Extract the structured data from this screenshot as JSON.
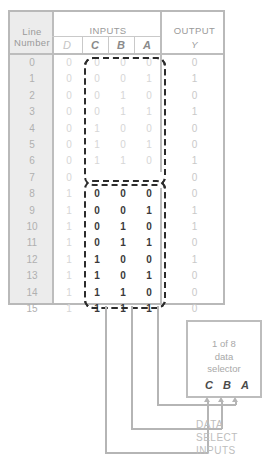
{
  "table": {
    "headers": {
      "line_number": "Line\nNumber",
      "line_number_l1": "Line",
      "line_number_l2": "Number",
      "inputs": "INPUTS",
      "output": "OUTPUT",
      "output_var": "Y",
      "vars": [
        "D",
        "C",
        "B",
        "A"
      ]
    },
    "rows": [
      {
        "line": "0",
        "D": "0",
        "C": "0",
        "B": "0",
        "A": "0",
        "Y": "0",
        "emphasis": "dim"
      },
      {
        "line": "1",
        "D": "0",
        "C": "0",
        "B": "0",
        "A": "1",
        "Y": "1",
        "emphasis": "dim"
      },
      {
        "line": "2",
        "D": "0",
        "C": "0",
        "B": "1",
        "A": "0",
        "Y": "0",
        "emphasis": "dim"
      },
      {
        "line": "3",
        "D": "0",
        "C": "0",
        "B": "1",
        "A": "1",
        "Y": "1",
        "emphasis": "dim"
      },
      {
        "line": "4",
        "D": "0",
        "C": "1",
        "B": "0",
        "A": "0",
        "Y": "0",
        "emphasis": "dim"
      },
      {
        "line": "5",
        "D": "0",
        "C": "1",
        "B": "0",
        "A": "1",
        "Y": "0",
        "emphasis": "dim"
      },
      {
        "line": "6",
        "D": "0",
        "C": "1",
        "B": "1",
        "A": "0",
        "Y": "1",
        "emphasis": "dim"
      },
      {
        "line": "7",
        "D": "0",
        "C": "1",
        "B": "1",
        "A": "1",
        "Y": "0",
        "emphasis": "dim"
      },
      {
        "line": "8",
        "D": "1",
        "C": "0",
        "B": "0",
        "A": "0",
        "Y": "0",
        "emphasis": "bold"
      },
      {
        "line": "9",
        "D": "1",
        "C": "0",
        "B": "0",
        "A": "1",
        "Y": "1",
        "emphasis": "bold"
      },
      {
        "line": "10",
        "D": "1",
        "C": "0",
        "B": "1",
        "A": "0",
        "Y": "1",
        "emphasis": "bold"
      },
      {
        "line": "11",
        "D": "1",
        "C": "0",
        "B": "1",
        "A": "1",
        "Y": "0",
        "emphasis": "bold"
      },
      {
        "line": "12",
        "D": "1",
        "C": "1",
        "B": "0",
        "A": "0",
        "Y": "1",
        "emphasis": "bold"
      },
      {
        "line": "13",
        "D": "1",
        "C": "1",
        "B": "0",
        "A": "1",
        "Y": "0",
        "emphasis": "bold"
      },
      {
        "line": "14",
        "D": "1",
        "C": "1",
        "B": "1",
        "A": "0",
        "Y": "0",
        "emphasis": "bold"
      },
      {
        "line": "15",
        "D": "1",
        "C": "1",
        "B": "1",
        "A": "1",
        "Y": "0",
        "emphasis": "bold"
      }
    ]
  },
  "selector": {
    "label_line1": "1 of 8",
    "label_line2": "data",
    "label_line3": "selector",
    "pins": [
      "C",
      "B",
      "A"
    ]
  },
  "annotations": {
    "data_select_l1": "DATA",
    "data_select_l2": "SELECT",
    "data_select_l3": "INPUTS"
  },
  "colors": {
    "border": "#bdbdbd",
    "grid": "#c9c9c9",
    "dim_text": "#d6d6d6",
    "bold_text": "#3a3a3a",
    "header_text": "#9a9a9a",
    "wire": "#b5b5b5",
    "dash": "#2b2b2b",
    "grey_column": "#ececec"
  }
}
